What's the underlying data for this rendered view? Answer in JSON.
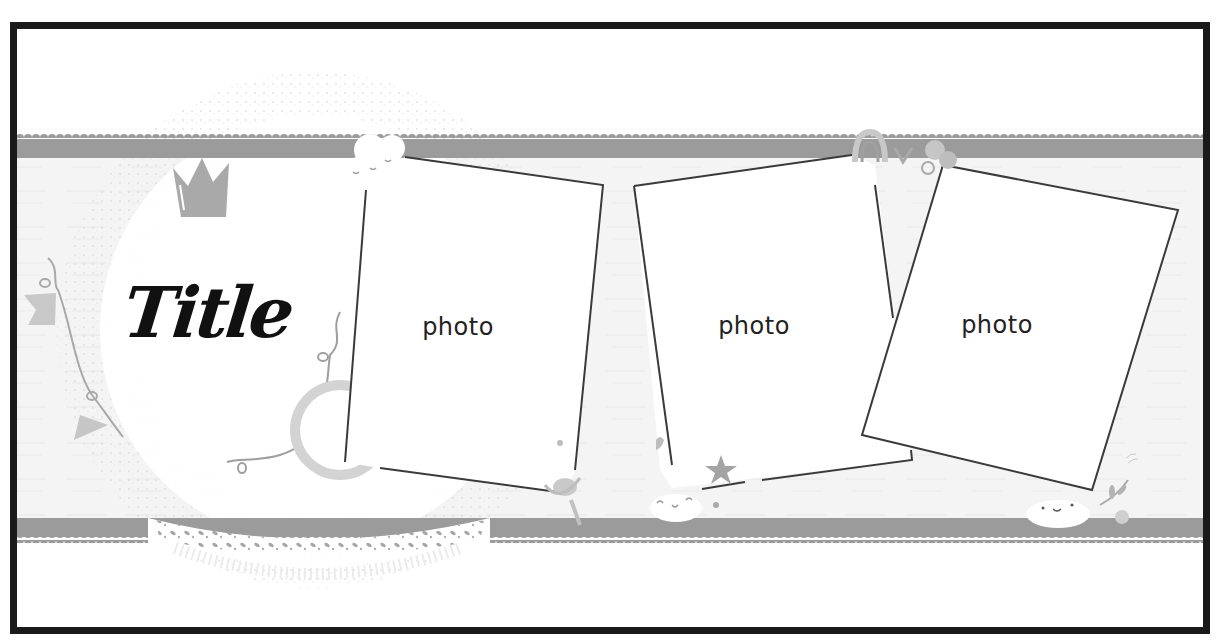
{
  "layout": {
    "title": "Title",
    "photo_slots": [
      {
        "label": "photo",
        "center": [
          458,
          327
        ]
      },
      {
        "label": "photo",
        "center": [
          754,
          326
        ]
      },
      {
        "label": "photo",
        "center": [
          997,
          325
        ]
      }
    ]
  },
  "decorations": {
    "icons": [
      "crown-icon",
      "bunting-icon",
      "doily-icon",
      "cloud-icon",
      "magnifier-icon",
      "star-icon",
      "rainbow-icon",
      "flower-icon",
      "leaf-icon",
      "scalloped-border-icon"
    ]
  },
  "colors": {
    "frame_border": "#1a1a1a",
    "band": "#9b9b9b",
    "background_light": "#f3f3f3",
    "photo_outline": "#3a3a3a",
    "decor_gray": "#bdbdbd"
  }
}
